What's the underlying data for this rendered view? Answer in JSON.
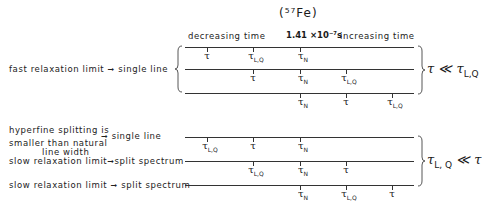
{
  "isotope": "(⁵⁷Fe)",
  "axis": {
    "left_label": "decreasing time",
    "center_label": "1.41 ×10⁻⁷s",
    "right_label": "increasing time"
  },
  "columns_x": [
    207,
    253,
    300,
    346,
    392
  ],
  "groups": [
    {
      "condition": "τ ≪ τ",
      "condition_sub": "L,Q",
      "condition_prefix_sub": "",
      "rows": [
        {
          "y": 47,
          "label": "",
          "ticks": [
            {
              "col": 0,
              "sym": "τ",
              "sub": ""
            },
            {
              "col": 1,
              "sym": "τ",
              "sub": "L,Q"
            },
            {
              "col": 2,
              "sym": "τ",
              "sub": "N"
            }
          ]
        },
        {
          "y": 69,
          "label": "",
          "ticks": [
            {
              "col": 1,
              "sym": "τ",
              "sub": ""
            },
            {
              "col": 2,
              "sym": "τ",
              "sub": "N"
            },
            {
              "col": 3,
              "sym": "τ",
              "sub": "L,Q"
            }
          ]
        },
        {
          "y": 93,
          "label": "",
          "ticks": [
            {
              "col": 2,
              "sym": "τ",
              "sub": "N"
            },
            {
              "col": 3,
              "sym": "τ",
              "sub": ""
            },
            {
              "col": 4,
              "sym": "τ",
              "sub": "L,Q"
            }
          ]
        }
      ],
      "side_label": "fast relaxation limit ➞ single line"
    },
    {
      "condition": "τ",
      "condition_sub": "L, Q",
      "condition_suffix": " ≪ τ",
      "rows": [
        {
          "y": 137,
          "label": "",
          "ticks": [
            {
              "col": 0,
              "sym": "τ",
              "sub": "L,Q"
            },
            {
              "col": 1,
              "sym": "τ",
              "sub": ""
            },
            {
              "col": 2,
              "sym": "τ",
              "sub": "N"
            }
          ]
        },
        {
          "y": 161,
          "label": "",
          "ticks": [
            {
              "col": 1,
              "sym": "τ",
              "sub": "L,Q"
            },
            {
              "col": 2,
              "sym": "τ",
              "sub": "N"
            },
            {
              "col": 3,
              "sym": "τ",
              "sub": ""
            }
          ]
        },
        {
          "y": 185,
          "label": "",
          "ticks": [
            {
              "col": 2,
              "sym": "τ",
              "sub": "N"
            },
            {
              "col": 3,
              "sym": "τ",
              "sub": "L,Q"
            },
            {
              "col": 4,
              "sym": "τ",
              "sub": ""
            }
          ]
        }
      ]
    }
  ],
  "left_labels": {
    "fast": {
      "text": "fast relaxation limit",
      "result": "single line"
    },
    "hyperfine_1": "hyperfine splitting is",
    "hyperfine_2": "smaller than natural",
    "hyperfine_3": "line width",
    "hyperfine_result": "single line",
    "slow1": {
      "text": "slow relaxation limit",
      "result": "split spectrum"
    },
    "slow2": {
      "text": "slow relaxation limit",
      "result": "split spectrum"
    },
    "arrow": "➞"
  }
}
